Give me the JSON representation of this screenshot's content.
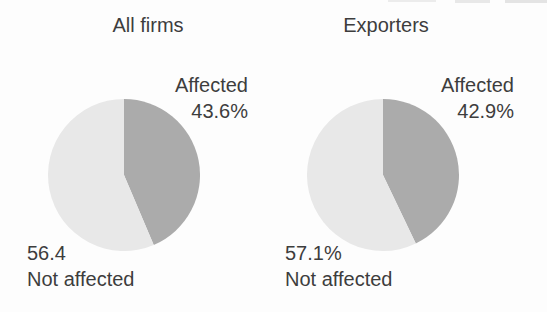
{
  "figure": {
    "background_color": "#fdfdfd",
    "text_color": "#3d3d3d"
  },
  "chart_data": [
    {
      "type": "pie",
      "title": "All firms",
      "start_angle": "top",
      "direction": "clockwise",
      "legend": "none",
      "slices": [
        {
          "label": "Affected",
          "value": 43.6,
          "display": "43.6%",
          "color": "#ababab"
        },
        {
          "label": "Not affected",
          "value": 56.4,
          "display": "56.4",
          "color": "#e8e8e8"
        }
      ]
    },
    {
      "type": "pie",
      "title": "Exporters",
      "start_angle": "top",
      "direction": "clockwise",
      "legend": "none",
      "slices": [
        {
          "label": "Affected",
          "value": 42.9,
          "display": "42.9%",
          "color": "#ababab"
        },
        {
          "label": "Not affected",
          "value": 57.1,
          "display": "57.1%",
          "color": "#e8e8e8"
        }
      ]
    }
  ]
}
